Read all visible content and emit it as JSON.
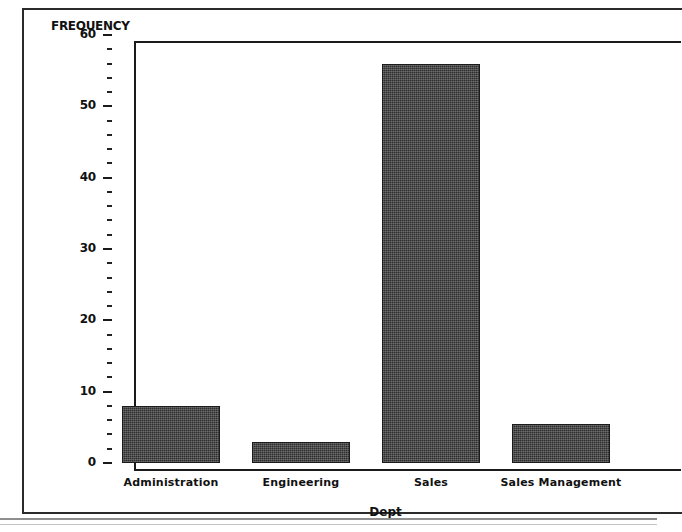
{
  "chart_data": {
    "type": "bar",
    "title": "",
    "xlabel": "Dept",
    "ylabel": "FREQUENCY",
    "categories": [
      "Administration",
      "Engineering",
      "Sales",
      "Sales Management"
    ],
    "values": [
      8,
      3,
      56,
      5.5
    ],
    "ylim": [
      0,
      60
    ],
    "ytick_labels": [
      "0",
      "10",
      "20",
      "30",
      "40",
      "50",
      "60"
    ],
    "ytick_values": [
      0,
      10,
      20,
      30,
      40,
      50,
      60
    ],
    "ytick_minor_step": 2,
    "grid": false,
    "legend": false,
    "bar_color": "#2e2e2e",
    "axis_color": "#1a1a1a",
    "background": "#ffffff"
  },
  "axes": {
    "y_title": "FREQUENCY",
    "x_title": "Dept"
  }
}
